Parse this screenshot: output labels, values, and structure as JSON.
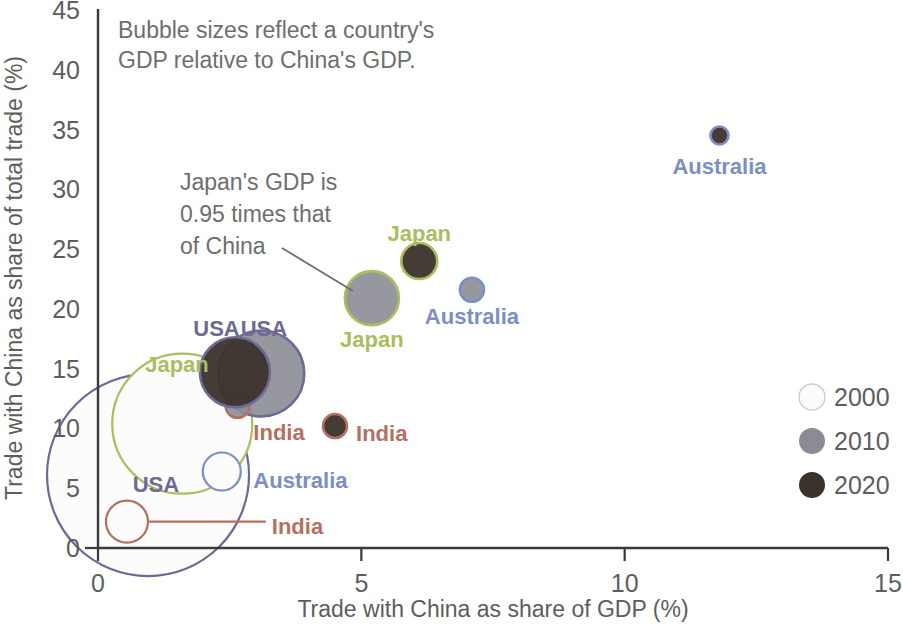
{
  "chart_data": {
    "type": "scatter",
    "subtype": "bubble",
    "title": "",
    "xlabel": "Trade with China as share of GDP (%)",
    "ylabel": "Trade with China as share of total trade (%)",
    "xlim": [
      0,
      15
    ],
    "ylim": [
      0,
      45
    ],
    "xticks": [
      "0",
      "5",
      "10",
      "15"
    ],
    "yticks": [
      "0",
      "5",
      "10",
      "15",
      "20",
      "25",
      "30",
      "35",
      "40",
      "45"
    ],
    "grid": false,
    "legend_position": "right-middle",
    "size_encoding": "Bubble area encodes the country's GDP relative to China's GDP",
    "annotations": [
      {
        "id": "size-note",
        "text_lines": [
          "Bubble sizes reflect a country's",
          "GDP relative to China's GDP."
        ]
      },
      {
        "id": "japan-note",
        "text_lines": [
          "Japan's GDP is",
          "0.95 times that",
          "of China"
        ],
        "points_to": "Japan 2010 bubble"
      }
    ],
    "legend": [
      {
        "label": "2000",
        "fill": "#fbfbfb",
        "stroke": "#cfcfcf"
      },
      {
        "label": "2010",
        "fill": "#8b8b95",
        "stroke": "#8b8b95"
      },
      {
        "label": "2020",
        "fill": "#3c322c",
        "stroke": "#3c322c"
      }
    ],
    "series": [
      {
        "name": "USA",
        "color": "#6c6a96",
        "points": [
          {
            "year": "2000",
            "x": 0.95,
            "y": 6.1,
            "r": 101,
            "label": "USA",
            "label_x": 1.1,
            "label_y": 5.3,
            "label_anchor": "middle"
          },
          {
            "year": "2010",
            "x": 3.1,
            "y": 14.6,
            "r": 43,
            "label": "USA",
            "label_x": 3.15,
            "label_y": 18.3,
            "label_anchor": "middle"
          },
          {
            "year": "2020",
            "x": 2.6,
            "y": 14.7,
            "r": 35,
            "label": "USA",
            "label_x": 2.25,
            "label_y": 18.3,
            "label_anchor": "middle"
          }
        ]
      },
      {
        "name": "Japan",
        "color": "#a9bd61",
        "points": [
          {
            "year": "2000",
            "x": 1.6,
            "y": 10.4,
            "r": 70,
            "label": "Japan",
            "label_x": 1.5,
            "label_y": 15.3,
            "label_anchor": "middle"
          },
          {
            "year": "2010",
            "x": 5.2,
            "y": 20.9,
            "r": 27,
            "label": "Japan",
            "label_x": 5.2,
            "label_y": 17.4,
            "label_anchor": "middle"
          },
          {
            "year": "2020",
            "x": 6.1,
            "y": 24.0,
            "r": 18,
            "label": "Japan",
            "label_x": 6.1,
            "label_y": 26.3,
            "label_anchor": "middle"
          }
        ]
      },
      {
        "name": "Australia",
        "color": "#7b8fc4",
        "points": [
          {
            "year": "2000",
            "x": 2.35,
            "y": 6.4,
            "r": 19,
            "label": "Australia",
            "label_x": 2.95,
            "label_y": 5.6,
            "label_anchor": "start"
          },
          {
            "year": "2010",
            "x": 7.1,
            "y": 21.6,
            "r": 12,
            "label": "Australia",
            "label_x": 7.1,
            "label_y": 19.3,
            "label_anchor": "middle"
          },
          {
            "year": "2020",
            "x": 11.8,
            "y": 34.5,
            "r": 9,
            "label": "Australia",
            "label_x": 11.8,
            "label_y": 31.9,
            "label_anchor": "middle"
          }
        ]
      },
      {
        "name": "India",
        "color": "#b5705f",
        "points": [
          {
            "year": "2000",
            "x": 0.55,
            "y": 2.2,
            "r": 21,
            "label": "India",
            "label_x": 3.3,
            "label_y": 1.75,
            "label_anchor": "start"
          },
          {
            "year": "2010",
            "x": 2.65,
            "y": 11.9,
            "r": 12,
            "label": "India",
            "label_x": 2.95,
            "label_y": 9.6,
            "label_anchor": "start"
          },
          {
            "year": "2020",
            "x": 4.5,
            "y": 10.2,
            "r": 12,
            "label": "India",
            "label_x": 4.9,
            "label_y": 9.55,
            "label_anchor": "start"
          }
        ]
      }
    ]
  },
  "axes": {
    "x_title": "Trade with China as share of GDP (%)",
    "y_title": "Trade with China as share of total trade (%)"
  },
  "notes": {
    "size_note_line1": "Bubble sizes reflect a country's",
    "size_note_line2": "GDP relative to China's GDP.",
    "japan_note_line1": "Japan's GDP is",
    "japan_note_line2": "0.95 times that",
    "japan_note_line3": "of China"
  }
}
